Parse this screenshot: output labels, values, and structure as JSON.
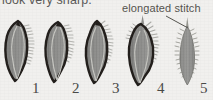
{
  "figure": {
    "caption_top": "look very sharp.",
    "annotation": {
      "label": "elongated stitch",
      "points_to": "5"
    },
    "background_color": "#f1f0ee",
    "outline_color": "#231f1c",
    "fill_color": "#8a8a88",
    "fill_color_light": "#9d9d9a",
    "stitch_color": "#b9b9b5",
    "rib_color": "#c9c9c4",
    "number_color": "#4a4a48",
    "specimens": [
      {
        "number": "1",
        "name": "valve-specimen-1",
        "outlined": true,
        "stitch_side": "right",
        "description": "asymmetric pointed leaf-shaped valve, thick dark outline, comb-like stitches along right margin"
      },
      {
        "number": "2",
        "name": "valve-specimen-2",
        "outlined": true,
        "stitch_side": "right",
        "description": "asymmetric pointed leaf-shaped valve, thick dark outline, stitches along upper right margin"
      },
      {
        "number": "3",
        "name": "valve-specimen-3",
        "outlined": true,
        "stitch_side": "right",
        "description": "narrower pointed valve, thick dark outline, stitches along right margin"
      },
      {
        "number": "4",
        "name": "valve-specimen-4",
        "outlined": true,
        "stitch_side": "both",
        "description": "broad pointed valve with elongated apical spine, stitches on both margins"
      },
      {
        "number": "5",
        "name": "valve-specimen-5",
        "outlined": false,
        "stitch_side": "both",
        "description": "narrow symmetric lens-shaped valve without dark outline, fine stitches on both margins"
      }
    ]
  }
}
